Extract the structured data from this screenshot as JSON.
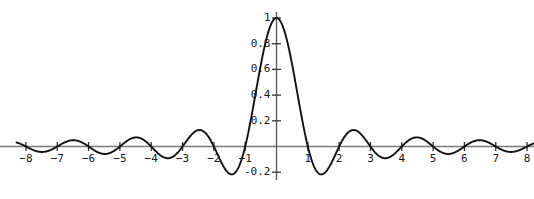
{
  "chart_data": {
    "type": "line",
    "title": "",
    "subtitle": "",
    "xlabel": "",
    "ylabel": "",
    "function": "sinc(x) = sin(pi*x)/(pi*x)",
    "xlim": [
      -8.3,
      8.3
    ],
    "ylim": [
      -0.25,
      1.05
    ],
    "grid": false,
    "legend": null,
    "axis_color": "#7a7a7a",
    "curve_color": "#111111",
    "text_color": "#171717",
    "background_color": "#ffffff",
    "x_ticks": [
      {
        "value": -8,
        "label": "−8"
      },
      {
        "value": -7,
        "label": "−7"
      },
      {
        "value": -6,
        "label": "−6"
      },
      {
        "value": -5,
        "label": "−5"
      },
      {
        "value": -4,
        "label": "−4"
      },
      {
        "value": -3,
        "label": "−3"
      },
      {
        "value": -2,
        "label": "−2"
      },
      {
        "value": -1,
        "label": "−1"
      },
      {
        "value": 1,
        "label": "1"
      },
      {
        "value": 2,
        "label": "2"
      },
      {
        "value": 3,
        "label": "3"
      },
      {
        "value": 4,
        "label": "4"
      },
      {
        "value": 5,
        "label": "5"
      },
      {
        "value": 6,
        "label": "6"
      },
      {
        "value": 7,
        "label": "7"
      },
      {
        "value": 8,
        "label": "8"
      }
    ],
    "y_ticks": [
      {
        "value": 1.0,
        "label": "1"
      },
      {
        "value": 0.8,
        "label": "0.8"
      },
      {
        "value": 0.6,
        "label": "0.6"
      },
      {
        "value": 0.4,
        "label": "0.4"
      },
      {
        "value": 0.2,
        "label": "0.2"
      },
      {
        "value": -0.2,
        "label": "-0.2"
      }
    ],
    "key_points": [
      {
        "x": -8.0,
        "y": 0.0
      },
      {
        "x": -7.5,
        "y": -0.0424
      },
      {
        "x": -7.0,
        "y": 0.0
      },
      {
        "x": -6.47,
        "y": 0.0491
      },
      {
        "x": -6.0,
        "y": 0.0
      },
      {
        "x": -5.48,
        "y": -0.058
      },
      {
        "x": -5.0,
        "y": 0.0
      },
      {
        "x": -4.48,
        "y": 0.0709
      },
      {
        "x": -4.0,
        "y": 0.0
      },
      {
        "x": -3.47,
        "y": -0.0913
      },
      {
        "x": -3.0,
        "y": 0.0
      },
      {
        "x": -2.46,
        "y": 0.1284
      },
      {
        "x": -2.0,
        "y": 0.0
      },
      {
        "x": -1.43,
        "y": -0.2172
      },
      {
        "x": -1.0,
        "y": 0.0
      },
      {
        "x": -0.5,
        "y": 0.6366
      },
      {
        "x": 0.0,
        "y": 1.0
      },
      {
        "x": 0.5,
        "y": 0.6366
      },
      {
        "x": 1.0,
        "y": 0.0
      },
      {
        "x": 1.43,
        "y": -0.2172
      },
      {
        "x": 2.0,
        "y": 0.0
      },
      {
        "x": 2.46,
        "y": 0.1284
      },
      {
        "x": 3.0,
        "y": 0.0
      },
      {
        "x": 3.47,
        "y": -0.0913
      },
      {
        "x": 4.0,
        "y": 0.0
      },
      {
        "x": 4.48,
        "y": 0.0709
      },
      {
        "x": 5.0,
        "y": 0.0
      },
      {
        "x": 5.48,
        "y": -0.058
      },
      {
        "x": 6.0,
        "y": 0.0
      },
      {
        "x": 6.47,
        "y": 0.0491
      },
      {
        "x": 7.0,
        "y": 0.0
      },
      {
        "x": 7.5,
        "y": -0.0424
      },
      {
        "x": 8.0,
        "y": 0.0
      }
    ]
  }
}
